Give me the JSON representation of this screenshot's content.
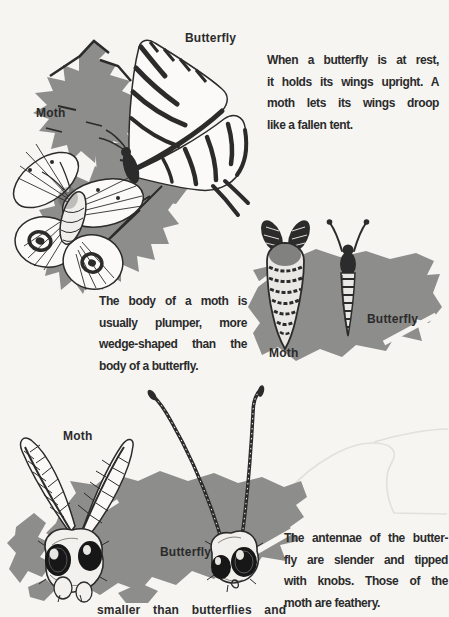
{
  "page": {
    "colors": {
      "bg": "#f6f5f2",
      "ink": "#2b2b2b",
      "gray": "#8d8d8b"
    }
  },
  "figure_rest": {
    "butterfly_label": "Butterfly",
    "moth_label": "Moth"
  },
  "caption_rest": {
    "lines": [
      "When a butterfly is at rest,",
      "it holds its wings upright. A",
      "moth lets its wings droop",
      "like a fallen tent."
    ]
  },
  "caption_body": {
    "lines": [
      "The body of a moth is",
      "usually plumper, more",
      "wedge-shaped than the",
      "body of a butterfly."
    ]
  },
  "figure_body": {
    "moth_label": "Moth",
    "butterfly_label": "Butterfly"
  },
  "figure_antennae": {
    "moth_label": "Moth",
    "butterfly_label": "Butterfly"
  },
  "caption_antennae": {
    "lines": [
      "The antennae of the butter-",
      "fly are slender and tipped",
      "with knobs. Those of the",
      "moth are feathery."
    ]
  },
  "clipped_bottom_line": {
    "text": "smaller than butterflies and"
  }
}
